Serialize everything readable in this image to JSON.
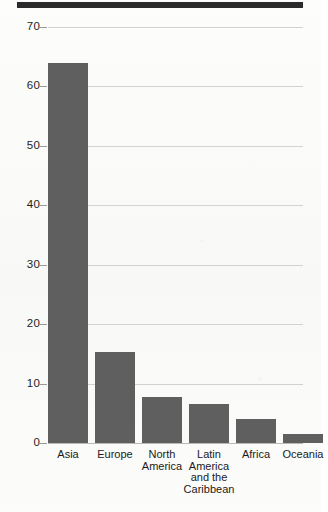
{
  "chart_data": {
    "type": "bar",
    "title": "",
    "subtitle": "",
    "xlabel": "",
    "ylabel": "",
    "categories": [
      "Asia",
      "Europe",
      "North America",
      "Latin America and the Caribbean",
      "Africa",
      "Oceania"
    ],
    "category_lines": [
      [
        "Asia"
      ],
      [
        "Europe"
      ],
      [
        "North",
        "America"
      ],
      [
        "Latin",
        "America",
        "and the",
        "Caribbean"
      ],
      [
        "Africa"
      ],
      [
        "Oceania"
      ]
    ],
    "values": [
      64,
      15.3,
      7.8,
      6.6,
      4.1,
      1.6
    ],
    "ylim": [
      0,
      70
    ],
    "yticks": [
      0,
      10,
      20,
      30,
      40,
      50,
      60,
      70
    ],
    "ytick_labels": [
      "0",
      "10",
      "20",
      "30",
      "40",
      "50",
      "60",
      "70"
    ],
    "grid": true,
    "grid_axis": "y",
    "legend": false,
    "bar_color": "#5f5f5f",
    "grid_color": "#d2d2d2",
    "axis_color": "#b9b9b9",
    "banner_color": "#2b2b2b"
  }
}
